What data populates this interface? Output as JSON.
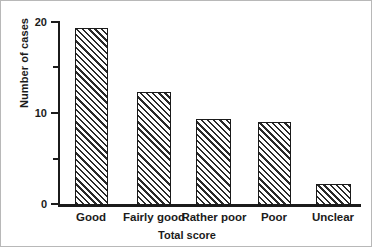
{
  "chart_data": {
    "type": "bar",
    "title": "",
    "xlabel": "Total score",
    "ylabel": "Number of cases",
    "categories": [
      "Good",
      "Fairly good",
      "Rather poor",
      "Poor",
      "Unclear"
    ],
    "values": [
      19.2,
      12.3,
      9.3,
      9.0,
      2.3
    ],
    "ylim": [
      0,
      20
    ],
    "yticks": [
      0,
      10,
      20
    ],
    "ytick_labels": [
      "0",
      "10",
      "20"
    ],
    "yminor_ticks": [
      5,
      15
    ],
    "grid": false,
    "legend": null,
    "bar_fill": "#ffffff",
    "bar_edge": "#1b1b1b",
    "bar_hatch": "diagonal-45",
    "axis_color": "#1b1b1b",
    "background": "#ffffff"
  }
}
